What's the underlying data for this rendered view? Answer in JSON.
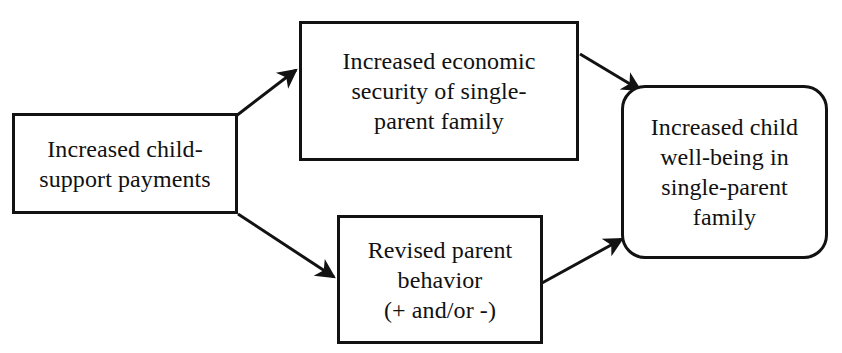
{
  "diagram": {
    "background_color": "#ffffff",
    "stroke_color": "#121212",
    "text_color": "#111111",
    "nodes": [
      {
        "id": "child-support",
        "label": "Increased child-\nsupport payments",
        "shape": "rectangle"
      },
      {
        "id": "economic-security",
        "label": "Increased economic\nsecurity of single-\nparent family",
        "shape": "rectangle"
      },
      {
        "id": "parent-behavior",
        "label": "Revised parent\nbehavior\n(+ and/or -)",
        "shape": "rectangle"
      },
      {
        "id": "child-wellbeing",
        "label": "Increased child\nwell-being in\nsingle-parent\nfamily",
        "shape": "rounded-rectangle"
      }
    ],
    "edges": [
      {
        "id": "edge-1",
        "from": "child-support",
        "to": "economic-security",
        "style": "solid-arrow"
      },
      {
        "id": "edge-2",
        "from": "child-support",
        "to": "parent-behavior",
        "style": "solid-arrow"
      },
      {
        "id": "edge-3",
        "from": "economic-security",
        "to": "child-wellbeing",
        "style": "solid-arrow"
      },
      {
        "id": "edge-4",
        "from": "parent-behavior",
        "to": "child-wellbeing",
        "style": "solid-arrow"
      }
    ]
  }
}
